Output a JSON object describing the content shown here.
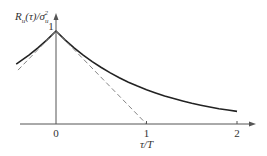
{
  "chart_data": {
    "type": "line",
    "title": "",
    "ylabel": {
      "main": "R",
      "main_sub": "u",
      "arg": "(τ)/σ",
      "den_sub": "u",
      "den_sup": "2"
    },
    "xlabel": "τ/T",
    "xlim": [
      -0.45,
      2.2
    ],
    "ylim": [
      0,
      1.2
    ],
    "grid": false,
    "x_ticks": [
      {
        "value": 0,
        "label": "0"
      },
      {
        "value": 1,
        "label": "1"
      },
      {
        "value": 2,
        "label": "2"
      }
    ],
    "y_ticks": [
      {
        "value": 1,
        "label": "1"
      }
    ],
    "series": [
      {
        "name": "autocorrelation exp(-|τ|/T)",
        "style": "solid",
        "color": "#222222",
        "x": [
          -0.44,
          -0.3,
          -0.2,
          -0.1,
          0,
          0.1,
          0.2,
          0.3,
          0.4,
          0.5,
          0.6,
          0.7,
          0.8,
          0.9,
          1.0,
          1.1,
          1.2,
          1.3,
          1.4,
          1.5,
          1.6,
          1.7,
          1.8,
          1.9,
          2.0
        ],
        "y": [
          0.644,
          0.741,
          0.819,
          0.905,
          1.0,
          0.905,
          0.819,
          0.741,
          0.67,
          0.607,
          0.549,
          0.497,
          0.449,
          0.407,
          0.368,
          0.333,
          0.301,
          0.273,
          0.247,
          0.223,
          0.202,
          0.183,
          0.165,
          0.15,
          0.135
        ]
      },
      {
        "name": "tangent at τ=0 (right)",
        "style": "dashed",
        "color": "#777777",
        "x": [
          0,
          1
        ],
        "y": [
          1,
          0
        ]
      },
      {
        "name": "tangent at τ=0 (left)",
        "style": "dashed",
        "color": "#777777",
        "x": [
          -0.42,
          0
        ],
        "y": [
          0.58,
          1
        ]
      }
    ]
  }
}
